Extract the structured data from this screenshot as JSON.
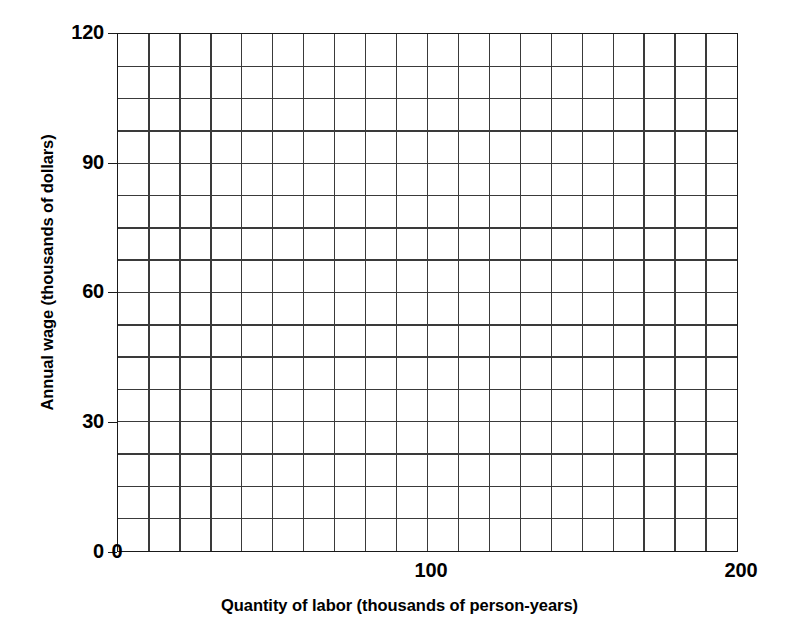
{
  "chart_data": {
    "type": "grid",
    "title": "",
    "xlabel": "Quantity of labor (thousands of person-years)",
    "ylabel": "Annual wage (thousands of dollars)",
    "xlim": [
      0,
      200
    ],
    "ylim": [
      0,
      120
    ],
    "x_ticks": [
      {
        "value": 0,
        "label": "0"
      },
      {
        "value": 100,
        "label": "100"
      },
      {
        "value": 200,
        "label": "200"
      }
    ],
    "y_ticks": [
      {
        "value": 0,
        "label": "0"
      },
      {
        "value": 30,
        "label": "30"
      },
      {
        "value": 60,
        "label": "60"
      },
      {
        "value": 90,
        "label": "90"
      },
      {
        "value": 120,
        "label": "120"
      }
    ],
    "grid": true,
    "grid_columns": 20,
    "grid_rows": 16,
    "x_grid_step": 10,
    "y_grid_step": 7.5,
    "series": [],
    "values": [],
    "legend": [],
    "annotations": [],
    "colors": {
      "background": "#ffffff",
      "grid_line": "#3a3a3a",
      "axis_line": "#1a1a1a",
      "text": "#000000"
    }
  },
  "axes": {
    "x_title": "Quantity of labor (thousands of person-years)",
    "y_title": "Annual wage (thousands of dollars)",
    "x_tick_labels": [
      "0",
      "100",
      "200"
    ],
    "y_tick_labels": [
      "120",
      "90",
      "60",
      "30",
      "0"
    ]
  }
}
